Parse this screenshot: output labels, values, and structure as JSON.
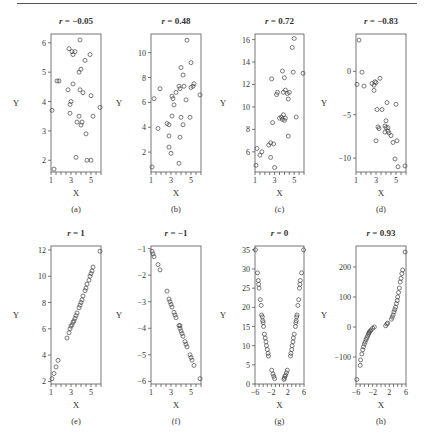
{
  "figure": {
    "caption_letters": [
      "(a)",
      "(b)",
      "(c)",
      "(d)",
      "(e)",
      "(f)",
      "(g)",
      "(h)"
    ]
  },
  "chart_data": [
    {
      "type": "scatter",
      "panel": "(a)",
      "title": "r = −0.05",
      "r_label": "r",
      "r_value": "−0.05",
      "xlabel": "X",
      "ylabel": "Y",
      "xlim": [
        1,
        6
      ],
      "ylim": [
        1.6,
        6.3
      ],
      "xticks": [
        1,
        3,
        5
      ],
      "xminor": [
        1,
        1.5,
        2,
        2.5,
        3,
        3.5,
        4,
        4.5,
        5,
        5.5,
        6
      ],
      "yticks": [
        2,
        3,
        4,
        5,
        6
      ],
      "points": [
        [
          1.1,
          3.7
        ],
        [
          1.3,
          1.7
        ],
        [
          1.6,
          4.7
        ],
        [
          1.8,
          4.7
        ],
        [
          2.7,
          4.4
        ],
        [
          2.8,
          5.8
        ],
        [
          2.9,
          3.6
        ],
        [
          2.9,
          3.9
        ],
        [
          3.0,
          4.0
        ],
        [
          3.1,
          5.7
        ],
        [
          3.2,
          5.6
        ],
        [
          3.2,
          4.6
        ],
        [
          3.4,
          5.7
        ],
        [
          3.5,
          2.1
        ],
        [
          3.6,
          3.3
        ],
        [
          3.8,
          3.5
        ],
        [
          3.8,
          5.0
        ],
        [
          3.9,
          4.4
        ],
        [
          3.9,
          6.1
        ],
        [
          4.0,
          5.1
        ],
        [
          4.0,
          3.2
        ],
        [
          4.1,
          3.3
        ],
        [
          4.2,
          4.3
        ],
        [
          4.4,
          5.4
        ],
        [
          4.5,
          2.9
        ],
        [
          4.6,
          2.0
        ],
        [
          4.9,
          5.6
        ],
        [
          5.0,
          2.0
        ],
        [
          5.0,
          4.2
        ],
        [
          5.2,
          3.5
        ],
        [
          5.9,
          3.8
        ]
      ]
    },
    {
      "type": "scatter",
      "panel": "(b)",
      "title": "r = 0.48",
      "r_label": "r",
      "r_value": "0.48",
      "xlabel": "X",
      "ylabel": "Y",
      "xlim": [
        1,
        6
      ],
      "ylim": [
        0.4,
        11.5
      ],
      "xticks": [
        1,
        3,
        5
      ],
      "xminor": [
        1,
        1.5,
        2,
        2.5,
        3,
        3.5,
        4,
        4.5,
        5,
        5.5,
        6
      ],
      "yticks": [
        2,
        4,
        6,
        8,
        10
      ],
      "points": [
        [
          1.1,
          0.8
        ],
        [
          1.3,
          6.3
        ],
        [
          1.7,
          3.9
        ],
        [
          1.9,
          7.1
        ],
        [
          2.6,
          4.3
        ],
        [
          2.8,
          4.2
        ],
        [
          2.8,
          3.3
        ],
        [
          2.8,
          2.4
        ],
        [
          3.0,
          1.9
        ],
        [
          3.1,
          6.5
        ],
        [
          3.1,
          4.9
        ],
        [
          3.2,
          6.3
        ],
        [
          3.3,
          5.8
        ],
        [
          3.5,
          6.8
        ],
        [
          3.8,
          1.1
        ],
        [
          3.8,
          7.3
        ],
        [
          3.9,
          3.2
        ],
        [
          3.9,
          7.1
        ],
        [
          4.0,
          8.8
        ],
        [
          4.0,
          4.8
        ],
        [
          4.2,
          8.2
        ],
        [
          4.2,
          4.2
        ],
        [
          4.3,
          7.3
        ],
        [
          4.5,
          6.2
        ],
        [
          4.6,
          11.0
        ],
        [
          4.9,
          4.8
        ],
        [
          5.0,
          9.2
        ],
        [
          5.0,
          7.2
        ],
        [
          5.2,
          7.3
        ],
        [
          5.3,
          7.5
        ],
        [
          5.9,
          6.6
        ]
      ]
    },
    {
      "type": "scatter",
      "panel": "(c)",
      "title": "r = 0.72",
      "r_label": "r",
      "r_value": "0.72",
      "xlabel": "X",
      "ylabel": "Y",
      "xlim": [
        1,
        6
      ],
      "ylim": [
        4.2,
        16.5
      ],
      "xticks": [
        1,
        3,
        5
      ],
      "xminor": [
        1,
        1.5,
        2,
        2.5,
        3,
        3.5,
        4,
        4.5,
        5,
        5.5,
        6
      ],
      "yticks": [
        6,
        8,
        10,
        12,
        14,
        16
      ],
      "points": [
        [
          1.1,
          4.8
        ],
        [
          1.2,
          6.3
        ],
        [
          1.5,
          5.7
        ],
        [
          1.7,
          6.0
        ],
        [
          2.4,
          6.6
        ],
        [
          2.6,
          6.8
        ],
        [
          2.6,
          5.5
        ],
        [
          2.7,
          12.5
        ],
        [
          2.8,
          8.6
        ],
        [
          2.9,
          6.7
        ],
        [
          3.0,
          4.6
        ],
        [
          3.2,
          11.1
        ],
        [
          3.3,
          11.3
        ],
        [
          3.5,
          9.0
        ],
        [
          3.7,
          9.1
        ],
        [
          3.8,
          13.2
        ],
        [
          3.8,
          8.9
        ],
        [
          3.9,
          11.3
        ],
        [
          3.9,
          9.3
        ],
        [
          4.0,
          12.6
        ],
        [
          4.0,
          8.8
        ],
        [
          4.1,
          9.0
        ],
        [
          4.1,
          11.5
        ],
        [
          4.3,
          11.2
        ],
        [
          4.4,
          10.7
        ],
        [
          4.4,
          7.4
        ],
        [
          4.5,
          11.3
        ],
        [
          4.8,
          15.3
        ],
        [
          4.9,
          13.1
        ],
        [
          5.0,
          16.1
        ],
        [
          5.2,
          9.1
        ],
        [
          5.9,
          13.0
        ]
      ]
    },
    {
      "type": "scatter",
      "panel": "(d)",
      "title": "r = −0.83",
      "r_label": "r",
      "r_value": "−0.83",
      "xlabel": "X",
      "ylabel": "Y",
      "xlim": [
        1,
        6
      ],
      "ylim": [
        -11.6,
        4.3
      ],
      "xticks": [
        1,
        3,
        5
      ],
      "xminor": [
        1,
        1.5,
        2,
        2.5,
        3,
        3.5,
        4,
        4.5,
        5,
        5.5,
        6
      ],
      "yticks": [
        0,
        -5,
        -10
      ],
      "points": [
        [
          1.3,
          3.6
        ],
        [
          1.1,
          -1.5
        ],
        [
          1.6,
          -0.1
        ],
        [
          1.8,
          -1.7
        ],
        [
          2.6,
          -1.4
        ],
        [
          2.8,
          -1.6
        ],
        [
          2.8,
          -2.2
        ],
        [
          2.9,
          -1.2
        ],
        [
          3.0,
          -8.0
        ],
        [
          3.0,
          -1.3
        ],
        [
          3.1,
          -4.4
        ],
        [
          3.2,
          -6.4
        ],
        [
          3.3,
          -6.6
        ],
        [
          3.4,
          -0.8
        ],
        [
          3.6,
          -4.4
        ],
        [
          3.9,
          -6.3
        ],
        [
          3.9,
          -7.0
        ],
        [
          4.0,
          -5.7
        ],
        [
          4.0,
          -6.5
        ],
        [
          4.1,
          -3.6
        ],
        [
          4.2,
          -6.9
        ],
        [
          4.2,
          -6.5
        ],
        [
          4.3,
          -7.1
        ],
        [
          4.5,
          -7.4
        ],
        [
          4.7,
          -8.2
        ],
        [
          4.9,
          -10.1
        ],
        [
          5.0,
          -3.8
        ],
        [
          5.1,
          -8.0
        ],
        [
          5.2,
          -11.0
        ],
        [
          5.9,
          -10.9
        ]
      ]
    },
    {
      "type": "scatter",
      "panel": "(e)",
      "title": "r = 1",
      "r_label": "r",
      "r_value": "1",
      "xlabel": "X",
      "ylabel": "Y",
      "xlim": [
        1,
        6
      ],
      "ylim": [
        1.8,
        12.3
      ],
      "xticks": [
        1,
        3,
        5
      ],
      "xminor": [
        1,
        1.5,
        2,
        2.5,
        3,
        3.5,
        4,
        4.5,
        5,
        5.5,
        6
      ],
      "yticks": [
        2,
        4,
        6,
        8,
        10,
        12
      ],
      "points": [
        [
          1.1,
          2.2
        ],
        [
          1.3,
          2.6
        ],
        [
          1.5,
          3.1
        ],
        [
          1.7,
          3.6
        ],
        [
          2.6,
          5.3
        ],
        [
          2.8,
          5.7
        ],
        [
          2.9,
          6.0
        ],
        [
          3.0,
          6.2
        ],
        [
          3.1,
          6.3
        ],
        [
          3.2,
          6.5
        ],
        [
          3.3,
          6.6
        ],
        [
          3.4,
          6.8
        ],
        [
          3.5,
          7.0
        ],
        [
          3.6,
          7.2
        ],
        [
          3.8,
          7.6
        ],
        [
          3.9,
          7.8
        ],
        [
          4.0,
          8.0
        ],
        [
          4.1,
          8.2
        ],
        [
          4.2,
          8.5
        ],
        [
          4.4,
          8.9
        ],
        [
          4.5,
          9.1
        ],
        [
          4.6,
          9.4
        ],
        [
          4.8,
          9.7
        ],
        [
          4.9,
          10.0
        ],
        [
          5.0,
          10.2
        ],
        [
          5.1,
          10.4
        ],
        [
          5.2,
          10.7
        ],
        [
          5.9,
          11.9
        ]
      ]
    },
    {
      "type": "scatter",
      "panel": "(f)",
      "title": "r = −1",
      "r_label": "r",
      "r_value": "−1",
      "xlabel": "X",
      "ylabel": "Y",
      "xlim": [
        1,
        6
      ],
      "ylim": [
        -6.1,
        -0.9
      ],
      "xticks": [
        1,
        3,
        5
      ],
      "xminor": [
        1,
        1.5,
        2,
        2.5,
        3,
        3.5,
        4,
        4.5,
        5,
        5.5,
        6
      ],
      "yticks": [
        -1,
        -2,
        -3,
        -4,
        -5,
        -6
      ],
      "points": [
        [
          1.1,
          -1.1
        ],
        [
          1.2,
          -1.2
        ],
        [
          1.3,
          -1.3
        ],
        [
          1.7,
          -1.6
        ],
        [
          1.9,
          -1.8
        ],
        [
          2.6,
          -2.6
        ],
        [
          2.8,
          -2.9
        ],
        [
          2.9,
          -3.0
        ],
        [
          3.0,
          -3.1
        ],
        [
          3.1,
          -3.2
        ],
        [
          3.3,
          -3.4
        ],
        [
          3.4,
          -3.5
        ],
        [
          3.5,
          -3.6
        ],
        [
          3.8,
          -3.9
        ],
        [
          3.9,
          -4.0
        ],
        [
          3.9,
          -3.9
        ],
        [
          4.0,
          -4.1
        ],
        [
          4.1,
          -4.2
        ],
        [
          4.2,
          -4.3
        ],
        [
          4.4,
          -4.5
        ],
        [
          4.5,
          -4.6
        ],
        [
          4.6,
          -4.7
        ],
        [
          4.9,
          -5.0
        ],
        [
          5.0,
          -5.1
        ],
        [
          5.1,
          -5.2
        ],
        [
          5.3,
          -5.4
        ],
        [
          5.9,
          -5.9
        ]
      ]
    },
    {
      "type": "scatter",
      "panel": "(g)",
      "title": "r = 0",
      "r_label": "r",
      "r_value": "0",
      "xlabel": "X",
      "ylabel": "Y",
      "xlim": [
        -6,
        6
      ],
      "ylim": [
        0,
        36
      ],
      "xticks": [
        -6,
        -2,
        2,
        6
      ],
      "xminor": [
        -6,
        -5,
        -4,
        -3,
        -2,
        -1,
        0,
        1,
        2,
        3,
        4,
        5,
        6
      ],
      "yticks": [
        0,
        5,
        10,
        15,
        20,
        25,
        30,
        35
      ],
      "points": [
        [
          -5.9,
          35
        ],
        [
          -5.4,
          29
        ],
        [
          -5.2,
          27
        ],
        [
          -5.1,
          26
        ],
        [
          -5.0,
          25
        ],
        [
          -4.7,
          22
        ],
        [
          -4.5,
          20.5
        ],
        [
          -4.4,
          18
        ],
        [
          -4.2,
          17.5
        ],
        [
          -4.1,
          16.5
        ],
        [
          -4.0,
          16
        ],
        [
          -3.9,
          15
        ],
        [
          -3.7,
          13
        ],
        [
          -3.5,
          12
        ],
        [
          -3.3,
          11
        ],
        [
          -3.2,
          10
        ],
        [
          -3.0,
          9
        ],
        [
          -2.8,
          8
        ],
        [
          -2.7,
          7.3
        ],
        [
          -1.9,
          3.6
        ],
        [
          -1.6,
          2.6
        ],
        [
          -1.4,
          2
        ],
        [
          -1.2,
          1.4
        ],
        [
          1.1,
          1.2
        ],
        [
          1.2,
          1.5
        ],
        [
          1.3,
          2
        ],
        [
          1.5,
          2.3
        ],
        [
          1.7,
          2.9
        ],
        [
          1.9,
          3.6
        ],
        [
          2.7,
          7.3
        ],
        [
          2.8,
          8
        ],
        [
          3.0,
          9
        ],
        [
          3.1,
          10
        ],
        [
          3.3,
          11
        ],
        [
          3.4,
          12
        ],
        [
          3.6,
          13
        ],
        [
          3.9,
          15
        ],
        [
          4.0,
          16
        ],
        [
          4.1,
          16.5
        ],
        [
          4.2,
          17.5
        ],
        [
          4.3,
          18
        ],
        [
          4.5,
          20.5
        ],
        [
          4.7,
          22
        ],
        [
          4.9,
          25
        ],
        [
          5.0,
          26
        ],
        [
          5.1,
          27
        ],
        [
          5.4,
          29
        ],
        [
          5.9,
          35
        ]
      ]
    },
    {
      "type": "scatter",
      "panel": "(h)",
      "title": "r = 0.93",
      "r_label": "r",
      "r_value": "0.93",
      "xlabel": "X",
      "ylabel": "Y",
      "xlim": [
        -6,
        6
      ],
      "ylim": [
        -190,
        270
      ],
      "xticks": [
        -6,
        -2,
        2,
        6
      ],
      "xminor": [
        -6,
        -5,
        -4,
        -3,
        -2,
        -1,
        0,
        1,
        2,
        3,
        4,
        5,
        6
      ],
      "yticks": [
        -100,
        0,
        100,
        200
      ],
      "points": [
        [
          -5.8,
          -175
        ],
        [
          -5.0,
          -128
        ],
        [
          -4.9,
          -110
        ],
        [
          -4.6,
          -90
        ],
        [
          -4.4,
          -76
        ],
        [
          -4.2,
          -66
        ],
        [
          -4.0,
          -57
        ],
        [
          -3.8,
          -50
        ],
        [
          -3.6,
          -42
        ],
        [
          -3.4,
          -36
        ],
        [
          -3.2,
          -30
        ],
        [
          -3.0,
          -24
        ],
        [
          -2.9,
          -20
        ],
        [
          -2.8,
          -17
        ],
        [
          -2.6,
          -14
        ],
        [
          -2.4,
          -10
        ],
        [
          -2.0,
          -4
        ],
        [
          -1.6,
          0
        ],
        [
          1.1,
          4
        ],
        [
          1.4,
          10
        ],
        [
          1.6,
          13
        ],
        [
          2.5,
          26
        ],
        [
          2.7,
          33
        ],
        [
          2.9,
          40
        ],
        [
          3.1,
          50
        ],
        [
          3.3,
          58
        ],
        [
          3.5,
          66
        ],
        [
          3.7,
          78
        ],
        [
          3.9,
          88
        ],
        [
          4.0,
          100
        ],
        [
          4.2,
          115
        ],
        [
          4.4,
          130
        ],
        [
          4.6,
          150
        ],
        [
          4.8,
          162
        ],
        [
          5.0,
          178
        ],
        [
          5.2,
          190
        ],
        [
          5.8,
          250
        ]
      ]
    }
  ]
}
